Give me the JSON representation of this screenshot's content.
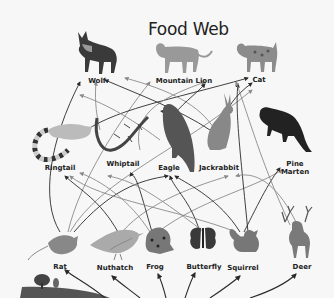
{
  "title": "Food Web",
  "organisms": {
    "wolf": {
      "label": "Wolf"
    },
    "mountain_lion": {
      "label": "Mountain Lion"
    },
    "cat": {
      "label": "Cat"
    },
    "ringtail": {
      "label": "Ringtail"
    },
    "whiptail": {
      "label": "Whiptail"
    },
    "eagle": {
      "label": "Eagle"
    },
    "jackrabbit": {
      "label": "Jackrabbit"
    },
    "pine_marten": {
      "label": "Pine\nMarten"
    },
    "rat": {
      "label": "Rat"
    },
    "nuthatch": {
      "label": "Nuthatch"
    },
    "frog": {
      "label": "Frog"
    },
    "butterfly": {
      "label": "Butterfly"
    },
    "squirrel": {
      "label": "Squirrel"
    },
    "deer": {
      "label": "Deer"
    }
  },
  "colors": {
    "background": "#f7f7f7",
    "arrow_dark": "#2a2a2a",
    "arrow_gray": "#8a8a8a"
  }
}
